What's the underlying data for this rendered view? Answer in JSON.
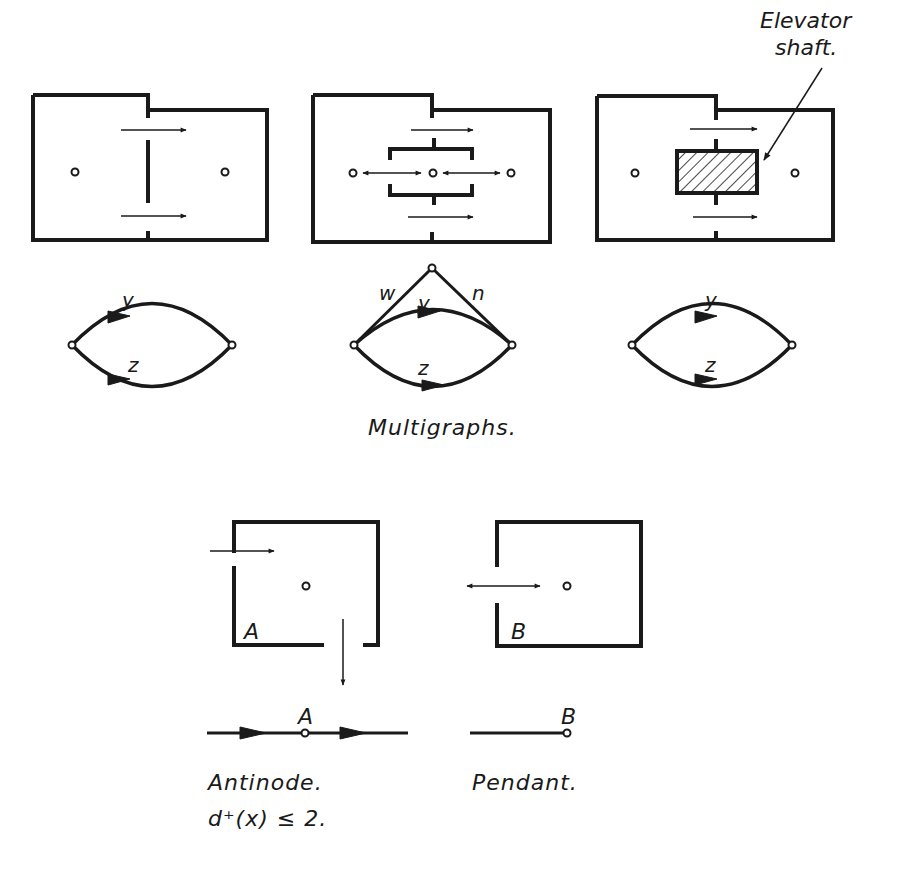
{
  "figure": {
    "top_row": {
      "panels": [
        {
          "id": "panel-1",
          "description": "two rooms connected by two doors"
        },
        {
          "id": "panel-2",
          "description": "two rooms connected through a central corridor"
        },
        {
          "id": "panel-3",
          "description": "two rooms around elevator shaft"
        }
      ],
      "annotation": {
        "line1": "Elevator",
        "line2": "shaft."
      }
    },
    "multigraphs": {
      "graphs": [
        {
          "id": "graph-1",
          "edges": [
            "y",
            "z"
          ]
        },
        {
          "id": "graph-2",
          "edges": [
            "w",
            "n",
            "y",
            "z"
          ]
        },
        {
          "id": "graph-3",
          "edges": [
            "y",
            "z"
          ]
        }
      ],
      "labels": {
        "y": "y",
        "z": "z",
        "w": "w",
        "n": "n"
      },
      "caption": "Multigraphs."
    },
    "bottom": {
      "room_a_label": "A",
      "room_b_label": "B",
      "node_a_label": "A",
      "node_b_label": "B",
      "antinode_caption": "Antinode.",
      "antinode_formula": "d⁺(x) ≤ 2.",
      "pendant_caption": "Pendant."
    },
    "colors": {
      "ink": "#1a1a1a",
      "background": "#ffffff"
    }
  }
}
